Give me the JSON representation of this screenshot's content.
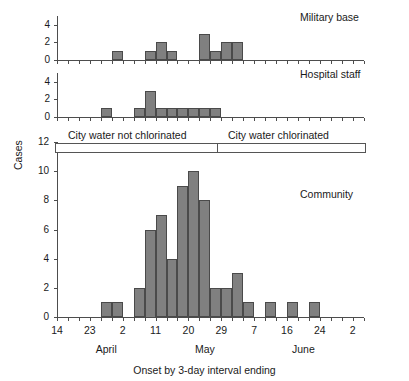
{
  "figure": {
    "caption": "Onset by 3-day interval ending",
    "y_axis_label": "Cases"
  },
  "annotation": {
    "left_label": "City water not chlorinated",
    "right_label": "City water chlorinated"
  },
  "x_axis": {
    "tick_labels": [
      "14",
      "23",
      "2",
      "11",
      "20",
      "29",
      "7",
      "16",
      "24",
      "2"
    ],
    "months": [
      "April",
      "May",
      "June"
    ],
    "n_intervals": 28
  },
  "panels": [
    {
      "title": "Military base",
      "y_ticks": [
        "0",
        "2",
        "4"
      ],
      "ymax": 5
    },
    {
      "title": "Hospital staff",
      "y_ticks": [
        "0",
        "2",
        "4"
      ],
      "ymax": 5
    },
    {
      "title": "Community",
      "y_ticks": [
        "0",
        "2",
        "4",
        "6",
        "8",
        "10",
        "12"
      ],
      "ymax": 12
    }
  ],
  "chart_data": [
    {
      "type": "bar",
      "title": "Military base",
      "xlabel": "Onset by 3-day interval ending",
      "ylabel": "Cases",
      "ylim": [
        0,
        5
      ],
      "yticks": [
        0,
        2,
        4
      ],
      "grid": false,
      "categories": [
        "14",
        "17",
        "20",
        "23",
        "26",
        "29",
        "2",
        "5",
        "8",
        "11",
        "14",
        "17",
        "20",
        "23",
        "26",
        "29",
        "1",
        "4",
        "7",
        "10",
        "13",
        "16",
        "19",
        "22",
        "24",
        "27",
        "30",
        "2"
      ],
      "values": [
        0,
        0,
        0,
        0,
        0,
        1,
        0,
        0,
        1,
        2,
        1,
        0,
        0,
        3,
        1,
        2,
        2,
        0,
        0,
        0,
        0,
        0,
        0,
        0,
        0,
        0,
        0,
        0
      ]
    },
    {
      "type": "bar",
      "title": "Hospital staff",
      "xlabel": "Onset by 3-day interval ending",
      "ylabel": "Cases",
      "ylim": [
        0,
        5
      ],
      "yticks": [
        0,
        2,
        4
      ],
      "grid": false,
      "categories": [
        "14",
        "17",
        "20",
        "23",
        "26",
        "29",
        "2",
        "5",
        "8",
        "11",
        "14",
        "17",
        "20",
        "23",
        "26",
        "29",
        "1",
        "4",
        "7",
        "10",
        "13",
        "16",
        "19",
        "22",
        "24",
        "27",
        "30",
        "2"
      ],
      "values": [
        0,
        0,
        0,
        0,
        1,
        0,
        0,
        1,
        3,
        1,
        1,
        1,
        1,
        1,
        1,
        0,
        0,
        0,
        0,
        0,
        0,
        0,
        0,
        0,
        0,
        0,
        0,
        0
      ]
    },
    {
      "type": "bar",
      "title": "Community",
      "xlabel": "Onset by 3-day interval ending",
      "ylabel": "Cases",
      "ylim": [
        0,
        12
      ],
      "yticks": [
        0,
        2,
        4,
        6,
        8,
        10,
        12
      ],
      "grid": false,
      "categories": [
        "14",
        "17",
        "20",
        "23",
        "26",
        "29",
        "2",
        "5",
        "8",
        "11",
        "14",
        "17",
        "20",
        "23",
        "26",
        "29",
        "1",
        "4",
        "7",
        "10",
        "13",
        "16",
        "19",
        "22",
        "24",
        "27",
        "30",
        "2"
      ],
      "values": [
        0,
        0,
        0,
        0,
        1,
        1,
        0,
        2,
        6,
        7,
        4,
        9,
        10,
        8,
        2,
        2,
        3,
        1,
        0,
        1,
        0,
        1,
        0,
        1,
        0,
        0,
        0,
        0
      ]
    }
  ]
}
